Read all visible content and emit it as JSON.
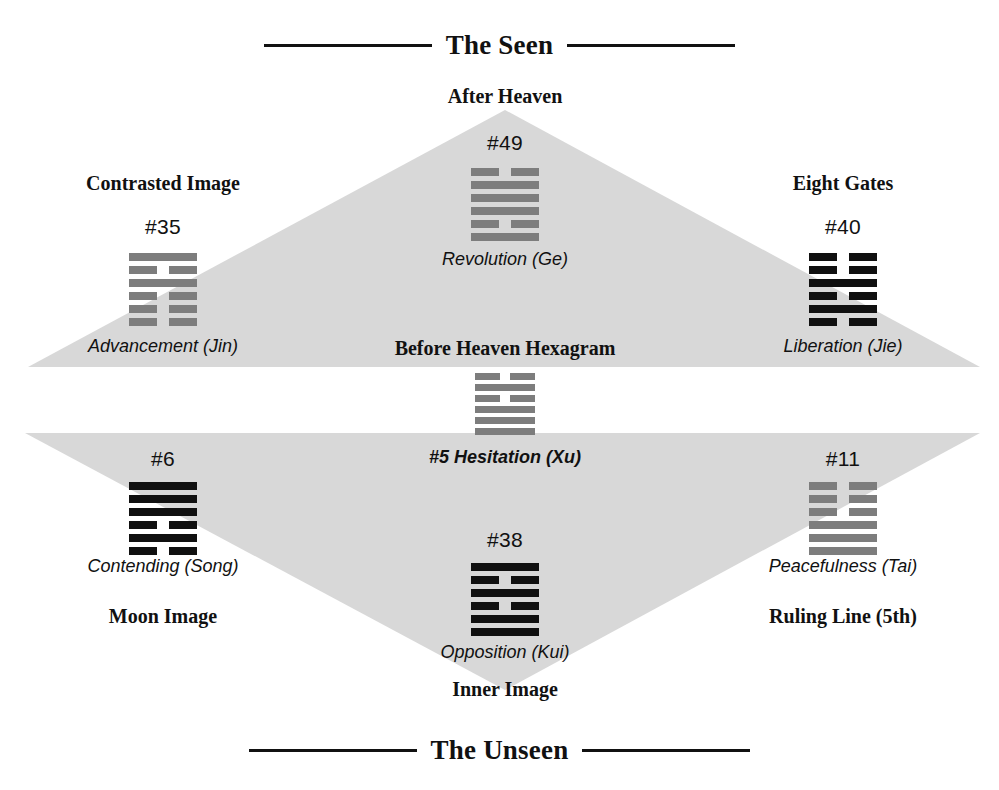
{
  "diagram": {
    "title_top": "The Seen",
    "title_bottom": "The Unseen",
    "center_label_upper": "Before Heaven Hexagram",
    "center_label_lower": "#5 Hesitation (Xu)",
    "apex_top_label": "After Heaven",
    "apex_bottom_label": "Inner Image",
    "colors": {
      "triangle_fill": "#d8d8d8",
      "dark_line": "#101010",
      "gray_line": "#7d7d7d",
      "rule": "#111111",
      "text": "#111111"
    }
  },
  "center_hexagram": {
    "id": "#5",
    "name": "Hesitation (Xu)",
    "caption": "#5 Hesitation (Xu)",
    "tone": "gray",
    "lines": [
      "broken",
      "solid",
      "broken",
      "solid",
      "solid",
      "solid"
    ]
  },
  "nodes": [
    {
      "key": "after-heaven",
      "heading": "After Heaven",
      "number": "#49",
      "caption": "Revolution (Ge)",
      "tone": "gray",
      "lines": [
        "broken",
        "solid",
        "solid",
        "solid",
        "broken",
        "solid"
      ]
    },
    {
      "key": "contrasted-image",
      "heading": "Contrasted Image",
      "number": "#35",
      "caption": "Advancement (Jin)",
      "tone": "gray",
      "lines": [
        "solid",
        "broken",
        "solid",
        "broken",
        "broken",
        "broken"
      ]
    },
    {
      "key": "eight-gates",
      "heading": "Eight Gates",
      "number": "#40",
      "caption": "Liberation (Jie)",
      "tone": "dark",
      "lines": [
        "broken",
        "broken",
        "solid",
        "broken",
        "solid",
        "broken"
      ]
    },
    {
      "key": "moon-image",
      "heading": "Moon Image",
      "number": "#6",
      "caption": "Contending (Song)",
      "tone": "dark",
      "lines": [
        "solid",
        "solid",
        "solid",
        "broken",
        "solid",
        "broken"
      ]
    },
    {
      "key": "ruling-line",
      "heading": "Ruling Line (5th)",
      "number": "#11",
      "caption": "Peacefulness (Tai)",
      "tone": "gray",
      "lines": [
        "broken",
        "broken",
        "broken",
        "solid",
        "solid",
        "solid"
      ]
    },
    {
      "key": "inner-image",
      "heading": "Inner Image",
      "number": "#38",
      "caption": "Opposition (Kui)",
      "tone": "dark",
      "lines": [
        "solid",
        "broken",
        "solid",
        "broken",
        "solid",
        "solid"
      ]
    }
  ]
}
